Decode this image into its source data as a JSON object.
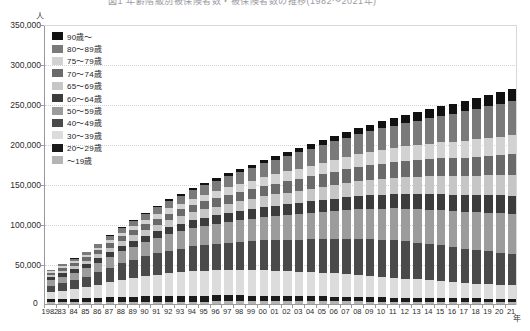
{
  "title": {
    "text": "図1 年齢階級別被保険者数・被保険者数の推移(1982～2021年)"
  },
  "axis": {
    "y_unit": "人",
    "x_unit": "年",
    "zero_label": "0"
  },
  "legend": {
    "items": [
      {
        "label": "90歳～",
        "color": "#111111"
      },
      {
        "label": "80～89歳",
        "color": "#7a7a7a"
      },
      {
        "label": "75～79歳",
        "color": "#d2d2d2"
      },
      {
        "label": "70～74歳",
        "color": "#6a6a6a"
      },
      {
        "label": "65～69歳",
        "color": "#c6c6c6"
      },
      {
        "label": "60～64歳",
        "color": "#3c3c3c"
      },
      {
        "label": "50～59歳",
        "color": "#9c9c9c"
      },
      {
        "label": "40～49歳",
        "color": "#4a4a4a"
      },
      {
        "label": "30～39歳",
        "color": "#dcdcdc"
      },
      {
        "label": "20～29歳",
        "color": "#1b1b1b"
      },
      {
        "label": "～19歳",
        "color": "#b4b4b4"
      }
    ]
  },
  "chart_data": {
    "type": "bar",
    "title": "図1 年齢階級別被保険者数・被保険者数の推移(1982～2021年)",
    "subtype": "stacked",
    "xlabel": "年",
    "ylabel": "人",
    "ylim": [
      0,
      350000
    ],
    "ytick_values": [
      0,
      50000,
      100000,
      150000,
      200000,
      250000,
      300000,
      350000
    ],
    "ytick_labels": [
      "0",
      "50,000",
      "100,000",
      "150,000",
      "200,000",
      "250,000",
      "300,000",
      "350,000"
    ],
    "grid": true,
    "legend_position": "top-left",
    "categories": [
      "1982",
      "83",
      "84",
      "85",
      "86",
      "87",
      "88",
      "89",
      "90",
      "91",
      "92",
      "93",
      "94",
      "95",
      "96",
      "97",
      "98",
      "99",
      "00",
      "01",
      "02",
      "03",
      "04",
      "05",
      "06",
      "07",
      "08",
      "09",
      "10",
      "11",
      "12",
      "13",
      "14",
      "15",
      "16",
      "17",
      "18",
      "19",
      "20",
      "21"
    ],
    "series": [
      {
        "name": "～19歳",
        "color": "#b4b4b4",
        "values": [
          2000,
          2100,
          2200,
          2300,
          2400,
          2500,
          2600,
          2700,
          2800,
          2900,
          3000,
          3000,
          3100,
          3100,
          3200,
          3200,
          3300,
          3300,
          3300,
          3300,
          3300,
          3300,
          3300,
          3300,
          3300,
          3200,
          3200,
          3100,
          3100,
          3000,
          3000,
          2900,
          2900,
          2800,
          2800,
          2700,
          2700,
          2600,
          2600,
          2500
        ]
      },
      {
        "name": "20～29歳",
        "color": "#1b1b1b",
        "values": [
          4000,
          4300,
          4600,
          5000,
          5400,
          5800,
          6200,
          6500,
          6800,
          7000,
          7200,
          7300,
          7400,
          7500,
          7500,
          7500,
          7400,
          7300,
          7200,
          7000,
          6800,
          6600,
          6400,
          6200,
          6000,
          5800,
          5600,
          5400,
          5200,
          5000,
          4900,
          4800,
          4700,
          4600,
          4500,
          4400,
          4300,
          4200,
          4100,
          4000
        ]
      },
      {
        "name": "30～39歳",
        "color": "#dcdcdc",
        "values": [
          9000,
          10500,
          12000,
          14000,
          16500,
          19000,
          21500,
          23500,
          25500,
          27000,
          28500,
          29500,
          30500,
          31000,
          31500,
          32000,
          32000,
          32000,
          32000,
          31500,
          31000,
          30500,
          30000,
          29500,
          29000,
          28500,
          28000,
          27000,
          26000,
          25000,
          24000,
          23000,
          22000,
          21000,
          20000,
          19000,
          18500,
          18000,
          17500,
          17000
        ]
      },
      {
        "name": "40～49歳",
        "color": "#4a4a4a",
        "values": [
          8000,
          9500,
          11000,
          13000,
          15500,
          18000,
          20500,
          22500,
          24500,
          26500,
          28000,
          29500,
          31000,
          32000,
          33000,
          34000,
          35000,
          36000,
          37000,
          38000,
          39000,
          40000,
          41000,
          42000,
          43000,
          44000,
          45000,
          45500,
          46000,
          46500,
          46500,
          46000,
          45500,
          45000,
          44000,
          43000,
          42000,
          41000,
          40000,
          39000
        ]
      },
      {
        "name": "50～59歳",
        "color": "#9c9c9c",
        "values": [
          7000,
          8000,
          9000,
          10500,
          12000,
          13500,
          15000,
          16500,
          18000,
          19500,
          21000,
          22000,
          23000,
          24000,
          25000,
          26000,
          27000,
          28000,
          29000,
          30000,
          31000,
          32000,
          33000,
          34000,
          35000,
          36000,
          37000,
          38000,
          39000,
          40000,
          41000,
          42000,
          43000,
          44000,
          45000,
          46000,
          47000,
          48000,
          49000,
          50000
        ]
      },
      {
        "name": "60～64歳",
        "color": "#3c3c3c",
        "values": [
          3500,
          4000,
          4500,
          5000,
          5500,
          6000,
          6500,
          7000,
          7500,
          8000,
          8500,
          9000,
          9500,
          10000,
          10500,
          11000,
          11500,
          12000,
          12500,
          13000,
          13500,
          14000,
          14500,
          15000,
          15500,
          16000,
          16500,
          17000,
          17500,
          18000,
          18500,
          19000,
          19500,
          20000,
          20500,
          21000,
          21500,
          22000,
          22500,
          23000
        ]
      },
      {
        "name": "65～69歳",
        "color": "#c6c6c6",
        "values": [
          3000,
          3500,
          4000,
          4600,
          5200,
          5800,
          6400,
          7000,
          7600,
          8200,
          8800,
          9400,
          10000,
          10600,
          11200,
          11800,
          12400,
          13000,
          13600,
          14200,
          14800,
          15400,
          16000,
          16600,
          17200,
          17800,
          18400,
          19000,
          19600,
          20200,
          20800,
          21400,
          22000,
          22600,
          23200,
          23800,
          24400,
          25000,
          25600,
          26200
        ]
      },
      {
        "name": "70～74歳",
        "color": "#6a6a6a",
        "values": [
          2500,
          3000,
          3500,
          4000,
          4600,
          5200,
          5800,
          6400,
          7000,
          7600,
          8200,
          8800,
          9400,
          10000,
          10600,
          11200,
          11800,
          12400,
          13000,
          13600,
          14200,
          14800,
          15400,
          16000,
          16600,
          17200,
          17800,
          18400,
          19000,
          19600,
          20200,
          20800,
          21400,
          22000,
          22600,
          23200,
          23800,
          24400,
          25000,
          25600
        ]
      },
      {
        "name": "75～79歳",
        "color": "#d2d2d2",
        "values": [
          1800,
          2200,
          2600,
          3000,
          3500,
          4000,
          4500,
          5000,
          5500,
          6000,
          6500,
          7000,
          7500,
          8000,
          8600,
          9200,
          9800,
          10400,
          11000,
          11600,
          12200,
          12800,
          13400,
          14000,
          14600,
          15200,
          15800,
          16400,
          17000,
          17600,
          18200,
          18800,
          19400,
          20000,
          20600,
          21200,
          21800,
          22400,
          23000,
          23600
        ]
      },
      {
        "name": "80～89歳",
        "color": "#7a7a7a",
        "values": [
          2000,
          2500,
          3000,
          3600,
          4300,
          5000,
          5800,
          6600,
          7500,
          8400,
          9300,
          10200,
          11200,
          12200,
          13200,
          14200,
          15200,
          16200,
          17200,
          18200,
          19200,
          20200,
          21200,
          22200,
          23200,
          24200,
          25200,
          26200,
          27200,
          28200,
          29200,
          30500,
          32000,
          33500,
          35000,
          36500,
          38000,
          39500,
          41000,
          42500
        ]
      },
      {
        "name": "90歳～",
        "color": "#111111",
        "values": [
          400,
          500,
          600,
          700,
          800,
          950,
          1100,
          1300,
          1500,
          1700,
          1900,
          2100,
          2400,
          2700,
          3000,
          3300,
          3600,
          3900,
          4300,
          4700,
          5100,
          5500,
          5900,
          6400,
          6900,
          7400,
          7900,
          8400,
          8900,
          9400,
          10000,
          10600,
          11200,
          11800,
          12400,
          13000,
          13600,
          14200,
          14800,
          15400
        ]
      }
    ]
  }
}
